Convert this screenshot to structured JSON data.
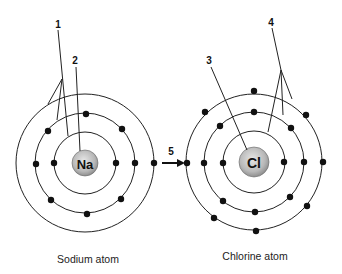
{
  "diagram": {
    "type": "bohr-model-ionic-bond",
    "atoms": [
      {
        "id": "sodium",
        "symbol": "Na",
        "caption": "Sodium atom",
        "center": [
          85,
          163
        ],
        "nucleus_radius": 12,
        "shells": [
          {
            "radius": 31,
            "electrons": [
              [
                54,
                163
              ],
              [
                116,
                163
              ]
            ]
          },
          {
            "radius": 50,
            "electrons": [
              [
                86,
                114
              ],
              [
                48,
                131
              ],
              [
                122,
                129
              ],
              [
                36,
                164
              ],
              [
                135,
                163
              ],
              [
                51,
                200
              ],
              [
                87,
                214
              ],
              [
                121,
                199
              ]
            ]
          },
          {
            "radius": 69,
            "electrons": [
              [
                154,
                163
              ]
            ]
          }
        ]
      },
      {
        "id": "chlorine",
        "symbol": "Cl",
        "caption": "Chlorine atom",
        "center": [
          254,
          162
        ],
        "nucleus_radius": 15,
        "shells": [
          {
            "radius": 31,
            "electrons": [
              [
                223,
                163
              ],
              [
                284,
                162
              ]
            ]
          },
          {
            "radius": 50,
            "electrons": [
              [
                254,
                112
              ],
              [
                220,
                126
              ],
              [
                291,
                128
              ],
              [
                204,
                163
              ],
              [
                304,
                162
              ],
              [
                223,
                201
              ],
              [
                255,
                212
              ],
              [
                290,
                197
              ]
            ]
          },
          {
            "radius": 68,
            "electrons": [
              [
                254,
                91
              ],
              [
                205,
                112
              ],
              [
                306,
                115
              ],
              [
                187,
                163
              ],
              [
                323,
                162
              ],
              [
                214,
                218
              ],
              [
                256,
                231
              ],
              [
                307,
                206
              ]
            ]
          }
        ]
      }
    ],
    "labels": [
      {
        "id": "1",
        "text": "1",
        "pos": [
          58,
          25
        ]
      },
      {
        "id": "2",
        "text": "2",
        "pos": [
          75,
          61
        ]
      },
      {
        "id": "3",
        "text": "3",
        "pos": [
          209,
          61
        ]
      },
      {
        "id": "4",
        "text": "4",
        "pos": [
          271,
          23
        ]
      },
      {
        "id": "5",
        "text": "5",
        "pos": [
          171,
          149
        ]
      }
    ],
    "arrow": {
      "from": [
        161,
        163
      ],
      "to": [
        184,
        163
      ],
      "label": "5"
    },
    "captions": {
      "sodium": "Sodium atom",
      "chlorine": "Chlorine atom"
    },
    "symbols": {
      "sodium": "Na",
      "chlorine": "Cl"
    },
    "colors": {
      "line": "#222222",
      "electron": "#111111",
      "nucleus_fill": "#bdbdbd",
      "background": "#ffffff"
    }
  }
}
